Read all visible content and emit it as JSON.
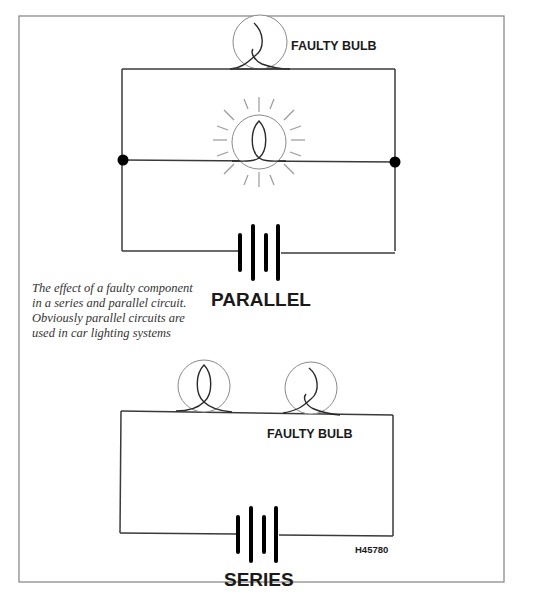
{
  "figure": {
    "reference_code": "H45780",
    "caption": "The effect of a faulty component in a series and parallel circuit. Obviously parallel circuits are used in car lighting systems",
    "colors": {
      "wire": "#3a3a3a",
      "bulb_outline": "#8a8a8a",
      "frame": "#8c8c8c",
      "text": "#1a1a1a"
    }
  },
  "parallel_circuit": {
    "title": "PARALLEL",
    "components": [
      {
        "type": "bulb",
        "state": "faulty",
        "label": "FAULTY BULB",
        "branch": "top"
      },
      {
        "type": "bulb",
        "state": "lit",
        "label": "",
        "branch": "middle"
      },
      {
        "type": "battery",
        "cells": 2,
        "branch": "bottom"
      },
      {
        "type": "junction",
        "side": "left"
      },
      {
        "type": "junction",
        "side": "right"
      }
    ]
  },
  "series_circuit": {
    "title": "SERIES",
    "components": [
      {
        "type": "bulb",
        "state": "off",
        "label": ""
      },
      {
        "type": "bulb",
        "state": "faulty",
        "label": "FAULTY BULB"
      },
      {
        "type": "battery",
        "cells": 2
      }
    ]
  }
}
